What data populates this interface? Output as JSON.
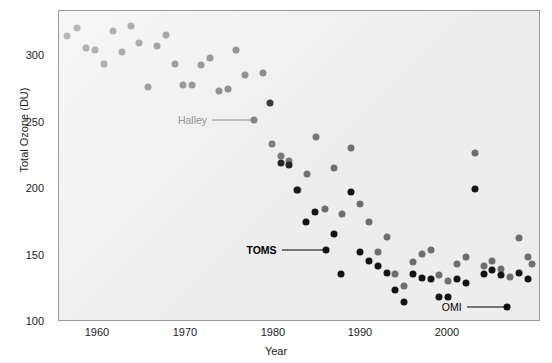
{
  "chart_data": {
    "type": "scatter",
    "title": "",
    "xlabel": "Year",
    "ylabel": "Total Ozone (DU)",
    "xlim": [
      1955.3,
      2009.9
    ],
    "ylim": [
      97,
      331
    ],
    "xticks": [
      1960,
      1970,
      1980,
      1990,
      2000
    ],
    "yticks": [
      100,
      150,
      200,
      250,
      300
    ],
    "grid": false,
    "legend_position": "none",
    "annotations": [
      {
        "label": "Halley",
        "points_to_x": 1977.4,
        "points_to_y": 249,
        "series": "Halley"
      },
      {
        "label": "TOMS",
        "points_to_x": 1985.5,
        "points_to_y": 151,
        "series": "TOMS / OMI"
      },
      {
        "label": "OMI",
        "points_to_x": 2006.0,
        "points_to_y": 108,
        "series": "TOMS / OMI"
      }
    ],
    "series": [
      {
        "name": "Halley",
        "color": "#6e6e6e",
        "marker": "circle",
        "points": [
          [
            1956.2,
            312
          ],
          [
            1957.3,
            318
          ],
          [
            1958.4,
            303
          ],
          [
            1959.4,
            302
          ],
          [
            1960.4,
            291
          ],
          [
            1961.4,
            316
          ],
          [
            1962.4,
            300
          ],
          [
            1963.4,
            320
          ],
          [
            1964.4,
            307
          ],
          [
            1965.4,
            274
          ],
          [
            1966.4,
            305
          ],
          [
            1967.4,
            313
          ],
          [
            1968.4,
            291
          ],
          [
            1969.4,
            275
          ],
          [
            1970.4,
            275
          ],
          [
            1971.4,
            290
          ],
          [
            1972.4,
            296
          ],
          [
            1973.4,
            271
          ],
          [
            1974.4,
            272
          ],
          [
            1975.4,
            302
          ],
          [
            1976.4,
            283
          ],
          [
            1977.4,
            249
          ],
          [
            1978.4,
            284
          ],
          [
            1979.4,
            231
          ],
          [
            1980.4,
            222
          ],
          [
            1981.4,
            218
          ],
          [
            1982.4,
            196
          ],
          [
            1983.4,
            208
          ],
          [
            1984.4,
            236
          ],
          [
            1985.4,
            182
          ],
          [
            1986.4,
            213
          ],
          [
            1987.4,
            178
          ],
          [
            1988.4,
            228
          ],
          [
            1989.4,
            186
          ],
          [
            1990.4,
            172
          ],
          [
            1991.4,
            150
          ],
          [
            1992.4,
            161
          ],
          [
            1993.4,
            133
          ],
          [
            1994.4,
            124
          ],
          [
            1995.4,
            142
          ],
          [
            1996.4,
            148
          ],
          [
            1997.4,
            151
          ],
          [
            1998.4,
            132
          ],
          [
            1999.4,
            128
          ],
          [
            2000.4,
            141
          ],
          [
            2001.4,
            146
          ],
          [
            2002.4,
            224
          ],
          [
            2003.4,
            139
          ],
          [
            2004.4,
            143
          ],
          [
            2005.4,
            137
          ],
          [
            2006.4,
            131
          ],
          [
            2007.4,
            160
          ],
          [
            2008.4,
            146
          ],
          [
            2008.9,
            141
          ]
        ]
      },
      {
        "name": "TOMS / OMI",
        "color": "#141414",
        "marker": "circle",
        "points": [
          [
            1979.2,
            262
          ],
          [
            1980.4,
            217
          ],
          [
            1981.3,
            215
          ],
          [
            1982.3,
            196
          ],
          [
            1983.3,
            172
          ],
          [
            1984.3,
            180
          ],
          [
            1985.5,
            151
          ],
          [
            1986.4,
            163
          ],
          [
            1987.3,
            133
          ],
          [
            1988.4,
            195
          ],
          [
            1989.4,
            150
          ],
          [
            1990.4,
            143
          ],
          [
            1991.4,
            139
          ],
          [
            1992.4,
            134
          ],
          [
            1993.4,
            121
          ],
          [
            1994.4,
            112
          ],
          [
            1995.4,
            133
          ],
          [
            1996.4,
            130
          ],
          [
            1997.4,
            129
          ],
          [
            1998.4,
            116
          ],
          [
            1999.4,
            116
          ],
          [
            2000.4,
            129
          ],
          [
            2001.4,
            126
          ],
          [
            2002.4,
            197
          ],
          [
            2003.4,
            133
          ],
          [
            2004.4,
            136
          ],
          [
            2005.4,
            132
          ],
          [
            2006.0,
            108
          ],
          [
            2007.4,
            134
          ],
          [
            2008.4,
            129
          ]
        ]
      }
    ]
  },
  "axis": {
    "y_title": "Total Ozone (DU)",
    "x_title": "Year",
    "y_tick_labels": [
      "300",
      "250",
      "200",
      "150",
      "100"
    ],
    "x_tick_labels": [
      "1960",
      "1970",
      "1980",
      "1990",
      "2000"
    ]
  },
  "annotations": {
    "halley_label": "Halley",
    "toms_label": "TOMS",
    "omi_label": "OMI"
  },
  "colors": {
    "halley_marker": "#6e6e6e",
    "satellite_marker": "#141414",
    "panel_background": "#ededed",
    "panel_border": "#9a9a9a"
  }
}
